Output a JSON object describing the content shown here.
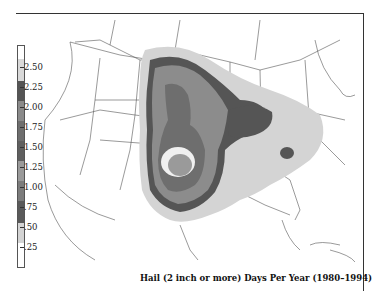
{
  "title": "Hail (2 inch or more) Days Per Year (1980–1994)",
  "legend": {
    "ticks": [
      ".25",
      ".50",
      ".75",
      "1.00",
      "1.25",
      "1.50",
      "1.75",
      "2.00",
      "2.25",
      "2.50"
    ],
    "bands": [
      {
        "range": "2.50+",
        "color": "#ffffff"
      },
      {
        "range": "2.25-2.50",
        "color": "#d9d9d9"
      },
      {
        "range": "2.00-2.25",
        "color": "#555555"
      },
      {
        "range": "1.75-2.00",
        "color": "#8a8a8a"
      },
      {
        "range": "1.50-1.75",
        "color": "#6e6e6e"
      },
      {
        "range": "1.25-1.50",
        "color": "#5f5f5f"
      },
      {
        "range": "1.00-1.25",
        "color": "#9a9a9a"
      },
      {
        "range": "0.75-1.00",
        "color": "#7c7c7c"
      },
      {
        "range": "0.50-0.75",
        "color": "#5a5a5a"
      },
      {
        "range": "0.25-0.50",
        "color": "#d3d3d3"
      },
      {
        "range": "0-0.25",
        "color": "#ffffff"
      }
    ]
  },
  "colors": {
    "outline": "#555555",
    "light": "#d4d4d4",
    "dark": "#555555",
    "mid": "#8c8c8c",
    "midlight": "#a6a6a6",
    "white": "#f0f0f0"
  }
}
